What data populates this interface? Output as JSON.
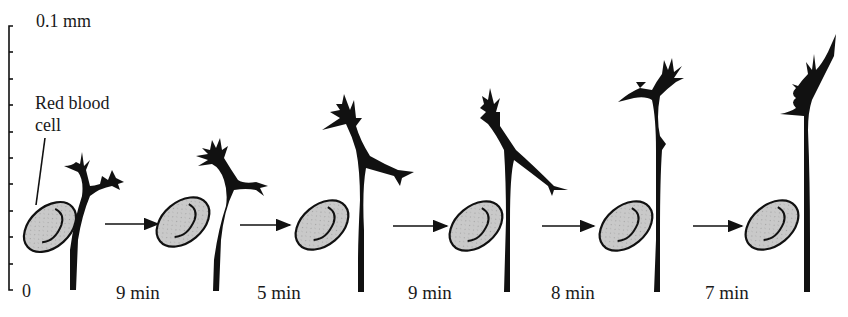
{
  "figure": {
    "scale_bar": {
      "top_label": "0.1 mm",
      "bottom_label": "0",
      "tick_count": 11
    },
    "annotation": {
      "red_blood_cell_line1": "Red blood",
      "red_blood_cell_line2": "cell"
    },
    "time_intervals": [
      {
        "label": "9 min"
      },
      {
        "label": "5 min"
      },
      {
        "label": "9 min"
      },
      {
        "label": "8 min"
      },
      {
        "label": "7 min"
      }
    ],
    "panels": 6,
    "colors": {
      "ink": "#111111",
      "cell_fill": "#c8c8c8",
      "background": "#ffffff"
    }
  }
}
